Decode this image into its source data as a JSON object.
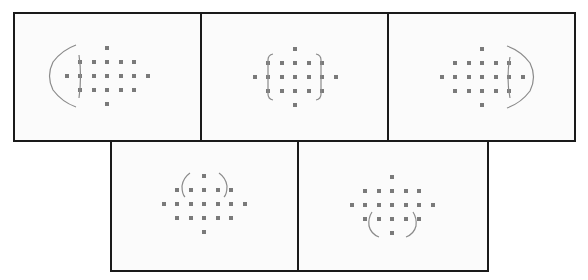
{
  "figure": {
    "point_color": "#7a7a7a",
    "bracket_color": "#888888",
    "border_color": "#1a1a1a"
  },
  "panels": [
    {
      "id": 1,
      "zone": "left",
      "center": [
        107,
        76
      ]
    },
    {
      "id": 2,
      "zone": "center",
      "center": [
        295,
        77
      ]
    },
    {
      "id": 3,
      "zone": "right",
      "center": [
        482,
        77
      ]
    },
    {
      "id": 4,
      "zone": "top",
      "center": [
        204,
        204
      ]
    },
    {
      "id": 5,
      "zone": "bottom",
      "center": [
        392,
        205
      ]
    }
  ]
}
